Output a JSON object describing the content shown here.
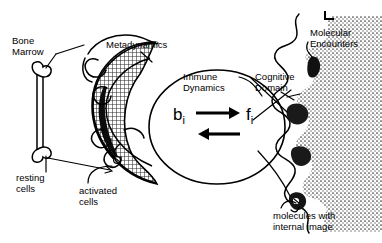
{
  "figure": {
    "style": "hand-drawn black and white scientific line diagram",
    "background_color": "#ffffff",
    "ink_color": "#000000"
  },
  "labels": {
    "bone_marrow": "Bone\nMarrow",
    "metadynamics": "Metadynamics",
    "immune_dynamics": "Immune\nDynamics",
    "cognitive_domain": "Cognitive\nDomain",
    "molecular_encounters": "Molecular\nEncounters",
    "resting_cells": "resting\ncells",
    "activated_cells": "activated\ncells",
    "molecules_internal_image": "molecules with\ninternal image"
  },
  "math": {
    "b_symbol": "b",
    "b_subscript": "i",
    "f_symbol": "f",
    "f_subscript": "i",
    "arrow_top": "right",
    "arrow_bottom": "left"
  },
  "regions": {
    "bone_marrow_icon": "bone-shape vertical bar with knobs at both ends",
    "metadynamics_crescent": "cross-hatched crescent ring",
    "activated_cell_band": "solid black band on inner left of crescent",
    "immune_dynamics_ellipse": "open ellipse outline",
    "cognitive_boundary": "scalloped lobed membrane with dark wedge receptors",
    "molecular_field": "stippled dotted field on right"
  }
}
